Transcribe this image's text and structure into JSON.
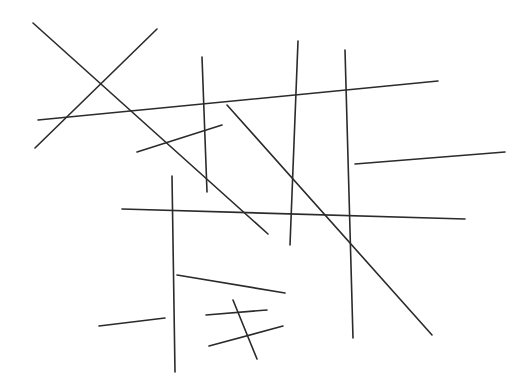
{
  "figure": {
    "type": "line-drawing",
    "width": 532,
    "height": 391,
    "background_color": "#ffffff",
    "stroke_color": "#2b2b2b",
    "stroke_width": 1.6,
    "segment_count": 14
  },
  "chart_data": {
    "type": "line",
    "xlabel": "",
    "ylabel": "",
    "xlim": [
      0,
      532
    ],
    "ylim": [
      0,
      391
    ],
    "grid": false,
    "legend": "none",
    "segments": [
      {
        "name": "segment-1",
        "x1": 33,
        "y1": 23,
        "x2": 268,
        "y2": 234
      },
      {
        "name": "segment-2",
        "x1": 157,
        "y1": 29,
        "x2": 35,
        "y2": 148
      },
      {
        "name": "segment-3",
        "x1": 202,
        "y1": 57,
        "x2": 207,
        "y2": 192
      },
      {
        "name": "segment-4",
        "x1": 298,
        "y1": 41,
        "x2": 290,
        "y2": 245
      },
      {
        "name": "segment-5",
        "x1": 345,
        "y1": 50,
        "x2": 353,
        "y2": 338
      },
      {
        "name": "segment-6",
        "x1": 38,
        "y1": 120,
        "x2": 438,
        "y2": 81
      },
      {
        "name": "segment-7",
        "x1": 355,
        "y1": 164,
        "x2": 505,
        "y2": 152
      },
      {
        "name": "segment-8",
        "x1": 137,
        "y1": 152,
        "x2": 222,
        "y2": 125
      },
      {
        "name": "segment-9",
        "x1": 122,
        "y1": 209,
        "x2": 465,
        "y2": 219
      },
      {
        "name": "segment-10",
        "x1": 172,
        "y1": 176,
        "x2": 175,
        "y2": 372
      },
      {
        "name": "segment-11",
        "x1": 99,
        "y1": 326,
        "x2": 165,
        "y2": 318
      },
      {
        "name": "segment-12",
        "x1": 177,
        "y1": 275,
        "x2": 285,
        "y2": 293
      },
      {
        "name": "segment-13",
        "x1": 206,
        "y1": 315,
        "x2": 267,
        "y2": 310
      },
      {
        "name": "segment-14",
        "x1": 209,
        "y1": 346,
        "x2": 283,
        "y2": 326
      },
      {
        "name": "segment-15",
        "x1": 233,
        "y1": 300,
        "x2": 257,
        "y2": 359
      },
      {
        "name": "segment-16",
        "x1": 227,
        "y1": 105,
        "x2": 432,
        "y2": 335
      }
    ]
  }
}
